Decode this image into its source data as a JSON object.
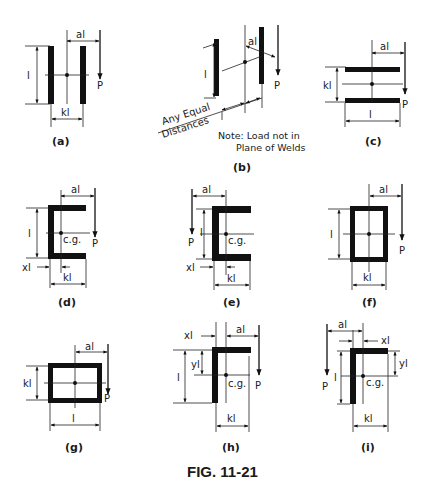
{
  "figure": {
    "title": "FIG. 11-21",
    "colors": {
      "ink": "#111111",
      "background": "#ffffff"
    }
  },
  "panels": [
    {
      "id": "a",
      "caption": "(a)",
      "shape": "two-vertical-welds",
      "labels": {
        "a": "al",
        "l": "l",
        "k": "kl",
        "load": "P"
      }
    },
    {
      "id": "b",
      "caption": "(b)",
      "shape": "two-offset-vertical-welds",
      "labels": {
        "a": "al",
        "l": "l",
        "load": "P",
        "spacing_1": "Any Equal",
        "spacing_2": "Distances",
        "note_1": "Note: Load not in",
        "note_2": "Plane of Welds"
      }
    },
    {
      "id": "c",
      "caption": "(c)",
      "shape": "two-horizontal-welds",
      "labels": {
        "a": "al",
        "l": "l",
        "k": "kl",
        "load": "P"
      }
    },
    {
      "id": "d",
      "caption": "(d)",
      "shape": "channel-open-right",
      "labels": {
        "a": "al",
        "l": "l",
        "k": "kl",
        "x": "xl",
        "cg": "c.g.",
        "load": "P"
      }
    },
    {
      "id": "e",
      "caption": "(e)",
      "shape": "channel-open-right-load-left",
      "labels": {
        "a": "al",
        "l": "l",
        "k": "kl",
        "x": "xl",
        "cg": "c.g.",
        "load": "P"
      }
    },
    {
      "id": "f",
      "caption": "(f)",
      "shape": "box-tall",
      "labels": {
        "a": "al",
        "l": "l",
        "k": "kl",
        "load": "P"
      }
    },
    {
      "id": "g",
      "caption": "(g)",
      "shape": "box-wide",
      "labels": {
        "a": "al",
        "l": "l",
        "k": "kl",
        "load": "P"
      }
    },
    {
      "id": "h",
      "caption": "(h)",
      "shape": "angle-load-right",
      "labels": {
        "a": "al",
        "l": "l",
        "k": "kl",
        "x": "xl",
        "y": "yl",
        "cg": "c.g.",
        "load": "P"
      }
    },
    {
      "id": "i",
      "caption": "(i)",
      "shape": "angle-load-left",
      "labels": {
        "a": "al",
        "l": "l",
        "k": "kl",
        "x": "xl",
        "y": "yl",
        "cg": "c.g.",
        "load": "P"
      }
    }
  ]
}
